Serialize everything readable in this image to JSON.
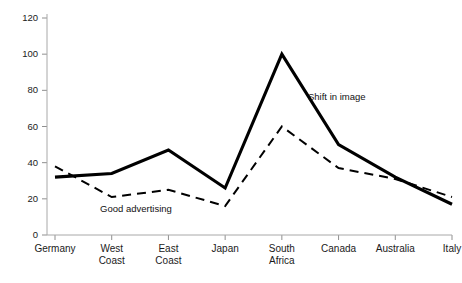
{
  "chart_data": {
    "type": "line",
    "title": "",
    "xlabel": "",
    "ylabel": "",
    "ylim": [
      0,
      120
    ],
    "ytick_values": [
      0,
      20,
      40,
      60,
      80,
      100,
      120
    ],
    "ytick_labels": [
      "0",
      "20",
      "40",
      "60",
      "80",
      "100",
      "120"
    ],
    "grid": false,
    "legend_position": "inline-annotations",
    "categories": [
      "Germany",
      "West Coast",
      "East Coast",
      "Japan",
      "South Africa",
      "Canada",
      "Australia",
      "Italy"
    ],
    "category_lines": [
      [
        "Germany"
      ],
      [
        "West",
        "Coast"
      ],
      [
        "East",
        "Coast"
      ],
      [
        "Japan"
      ],
      [
        "South",
        "Africa"
      ],
      [
        "Canada"
      ],
      [
        "Australia"
      ],
      [
        "Italy"
      ]
    ],
    "series": [
      {
        "name": "Shift in image",
        "style": "solid",
        "color": "#000000",
        "values": [
          32,
          34,
          47,
          26,
          100,
          50,
          32,
          17
        ]
      },
      {
        "name": "Good advertising",
        "style": "dashed",
        "color": "#000000",
        "values": [
          38,
          21,
          25,
          16,
          60,
          37,
          31,
          21
        ]
      }
    ],
    "annotations": [
      {
        "text": "Shift in image",
        "series": "Shift in image",
        "x_px": 308,
        "y_px": 100
      },
      {
        "text": "Good advertising",
        "series": "Good advertising",
        "x_px": 100,
        "y_px": 212
      }
    ]
  },
  "colors": {
    "background": "#ffffff",
    "axis": "#a8a8a8",
    "tick": "#8f8f8f",
    "text": "#1a1a1a",
    "series": "#000000"
  }
}
